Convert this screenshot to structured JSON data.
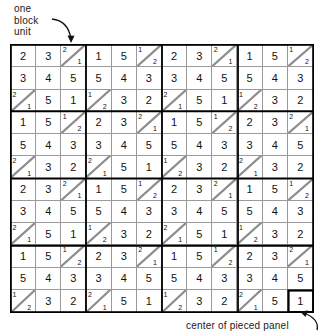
{
  "annotations": {
    "top_label": "one\nblock\nunit",
    "bottom_label": "center of pieced panel",
    "top_arrow_icon": "curved-arrow-down-right-icon",
    "bottom_arrow_icon": "curved-arrow-up-right-icon"
  },
  "grid": {
    "columns": 12,
    "rows": 12,
    "block_unit_size": 3,
    "line_color": "#9a9a9a",
    "bold_line_color": "#000000",
    "diagonal_direction": "bottom-left-to-top-right",
    "cells": [
      [
        {
          "type": "plain",
          "value": "2"
        },
        {
          "type": "plain",
          "value": "3"
        },
        {
          "type": "split",
          "top": "2",
          "bottom": "1"
        },
        {
          "type": "plain",
          "value": "1"
        },
        {
          "type": "plain",
          "value": "5"
        },
        {
          "type": "split",
          "top": "1",
          "bottom": "2"
        },
        {
          "type": "plain",
          "value": "2"
        },
        {
          "type": "plain",
          "value": "3"
        },
        {
          "type": "split",
          "top": "2",
          "bottom": "1"
        },
        {
          "type": "plain",
          "value": "1"
        },
        {
          "type": "plain",
          "value": "5"
        },
        {
          "type": "split",
          "top": "1",
          "bottom": "2"
        }
      ],
      [
        {
          "type": "plain",
          "value": "3"
        },
        {
          "type": "plain",
          "value": "4"
        },
        {
          "type": "plain",
          "value": "5"
        },
        {
          "type": "plain",
          "value": "5"
        },
        {
          "type": "plain",
          "value": "4"
        },
        {
          "type": "plain",
          "value": "3"
        },
        {
          "type": "plain",
          "value": "3"
        },
        {
          "type": "plain",
          "value": "4"
        },
        {
          "type": "plain",
          "value": "5"
        },
        {
          "type": "plain",
          "value": "5"
        },
        {
          "type": "plain",
          "value": "4"
        },
        {
          "type": "plain",
          "value": "3"
        }
      ],
      [
        {
          "type": "split",
          "top": "2",
          "bottom": "1"
        },
        {
          "type": "plain",
          "value": "5"
        },
        {
          "type": "plain",
          "value": "1"
        },
        {
          "type": "split",
          "top": "1",
          "bottom": "2"
        },
        {
          "type": "plain",
          "value": "3"
        },
        {
          "type": "plain",
          "value": "2"
        },
        {
          "type": "split",
          "top": "2",
          "bottom": "1"
        },
        {
          "type": "plain",
          "value": "5"
        },
        {
          "type": "plain",
          "value": "1"
        },
        {
          "type": "split",
          "top": "1",
          "bottom": "2"
        },
        {
          "type": "plain",
          "value": "3"
        },
        {
          "type": "plain",
          "value": "2"
        }
      ],
      [
        {
          "type": "plain",
          "value": "1"
        },
        {
          "type": "plain",
          "value": "5"
        },
        {
          "type": "split",
          "top": "1",
          "bottom": "2"
        },
        {
          "type": "plain",
          "value": "2"
        },
        {
          "type": "plain",
          "value": "3"
        },
        {
          "type": "split",
          "top": "2",
          "bottom": "1"
        },
        {
          "type": "plain",
          "value": "1"
        },
        {
          "type": "plain",
          "value": "5"
        },
        {
          "type": "split",
          "top": "1",
          "bottom": "2"
        },
        {
          "type": "plain",
          "value": "2"
        },
        {
          "type": "plain",
          "value": "3"
        },
        {
          "type": "split",
          "top": "2",
          "bottom": "1"
        }
      ],
      [
        {
          "type": "plain",
          "value": "5"
        },
        {
          "type": "plain",
          "value": "4"
        },
        {
          "type": "plain",
          "value": "3"
        },
        {
          "type": "plain",
          "value": "3"
        },
        {
          "type": "plain",
          "value": "4"
        },
        {
          "type": "plain",
          "value": "5"
        },
        {
          "type": "plain",
          "value": "5"
        },
        {
          "type": "plain",
          "value": "4"
        },
        {
          "type": "plain",
          "value": "3"
        },
        {
          "type": "plain",
          "value": "3"
        },
        {
          "type": "plain",
          "value": "4"
        },
        {
          "type": "plain",
          "value": "5"
        }
      ],
      [
        {
          "type": "split",
          "top": "2",
          "bottom": "1"
        },
        {
          "type": "plain",
          "value": "3"
        },
        {
          "type": "plain",
          "value": "2"
        },
        {
          "type": "split",
          "top": "2",
          "bottom": "1"
        },
        {
          "type": "plain",
          "value": "5"
        },
        {
          "type": "plain",
          "value": "1"
        },
        {
          "type": "split",
          "top": "1",
          "bottom": "2"
        },
        {
          "type": "plain",
          "value": "3"
        },
        {
          "type": "plain",
          "value": "2"
        },
        {
          "type": "split",
          "top": "2",
          "bottom": "1"
        },
        {
          "type": "plain",
          "value": "3"
        },
        {
          "type": "plain",
          "value": "2"
        }
      ],
      [
        {
          "type": "plain",
          "value": "2"
        },
        {
          "type": "plain",
          "value": "3"
        },
        {
          "type": "split",
          "top": "2",
          "bottom": "1"
        },
        {
          "type": "plain",
          "value": "1"
        },
        {
          "type": "plain",
          "value": "5"
        },
        {
          "type": "split",
          "top": "1",
          "bottom": "2"
        },
        {
          "type": "plain",
          "value": "2"
        },
        {
          "type": "plain",
          "value": "3"
        },
        {
          "type": "split",
          "top": "2",
          "bottom": "1"
        },
        {
          "type": "plain",
          "value": "1"
        },
        {
          "type": "plain",
          "value": "5"
        },
        {
          "type": "split",
          "top": "1",
          "bottom": "2"
        }
      ],
      [
        {
          "type": "plain",
          "value": "3"
        },
        {
          "type": "plain",
          "value": "4"
        },
        {
          "type": "plain",
          "value": "5"
        },
        {
          "type": "plain",
          "value": "5"
        },
        {
          "type": "plain",
          "value": "4"
        },
        {
          "type": "plain",
          "value": "3"
        },
        {
          "type": "plain",
          "value": "3"
        },
        {
          "type": "plain",
          "value": "4"
        },
        {
          "type": "plain",
          "value": "5"
        },
        {
          "type": "plain",
          "value": "5"
        },
        {
          "type": "plain",
          "value": "4"
        },
        {
          "type": "plain",
          "value": "3"
        }
      ],
      [
        {
          "type": "split",
          "top": "2",
          "bottom": "1"
        },
        {
          "type": "plain",
          "value": "5"
        },
        {
          "type": "plain",
          "value": "1"
        },
        {
          "type": "split",
          "top": "1",
          "bottom": "2"
        },
        {
          "type": "plain",
          "value": "3"
        },
        {
          "type": "plain",
          "value": "2"
        },
        {
          "type": "split",
          "top": "2",
          "bottom": "1"
        },
        {
          "type": "plain",
          "value": "5"
        },
        {
          "type": "plain",
          "value": "1"
        },
        {
          "type": "split",
          "top": "1",
          "bottom": "2"
        },
        {
          "type": "plain",
          "value": "3"
        },
        {
          "type": "plain",
          "value": "2"
        }
      ],
      [
        {
          "type": "plain",
          "value": "1"
        },
        {
          "type": "plain",
          "value": "5"
        },
        {
          "type": "split",
          "top": "1",
          "bottom": "2"
        },
        {
          "type": "plain",
          "value": "2"
        },
        {
          "type": "plain",
          "value": "3"
        },
        {
          "type": "split",
          "top": "2",
          "bottom": "1"
        },
        {
          "type": "plain",
          "value": "1"
        },
        {
          "type": "plain",
          "value": "5"
        },
        {
          "type": "split",
          "top": "1",
          "bottom": "2"
        },
        {
          "type": "plain",
          "value": "2"
        },
        {
          "type": "plain",
          "value": "3"
        },
        {
          "type": "split",
          "top": "2",
          "bottom": "1"
        }
      ],
      [
        {
          "type": "plain",
          "value": "5"
        },
        {
          "type": "plain",
          "value": "4"
        },
        {
          "type": "plain",
          "value": "3"
        },
        {
          "type": "plain",
          "value": "3"
        },
        {
          "type": "plain",
          "value": "4"
        },
        {
          "type": "plain",
          "value": "5"
        },
        {
          "type": "plain",
          "value": "5"
        },
        {
          "type": "plain",
          "value": "4"
        },
        {
          "type": "plain",
          "value": "3"
        },
        {
          "type": "plain",
          "value": "3"
        },
        {
          "type": "plain",
          "value": "4"
        },
        {
          "type": "plain",
          "value": "5"
        }
      ],
      [
        {
          "type": "split",
          "top": "1",
          "bottom": "2"
        },
        {
          "type": "plain",
          "value": "3"
        },
        {
          "type": "plain",
          "value": "2"
        },
        {
          "type": "split",
          "top": "2",
          "bottom": "1"
        },
        {
          "type": "plain",
          "value": "5"
        },
        {
          "type": "plain",
          "value": "1"
        },
        {
          "type": "split",
          "top": "1",
          "bottom": "2"
        },
        {
          "type": "plain",
          "value": "3"
        },
        {
          "type": "plain",
          "value": "2"
        },
        {
          "type": "split",
          "top": "2",
          "bottom": "1"
        },
        {
          "type": "plain",
          "value": "5"
        },
        {
          "type": "plain",
          "value": "1",
          "highlight": true
        }
      ]
    ]
  }
}
